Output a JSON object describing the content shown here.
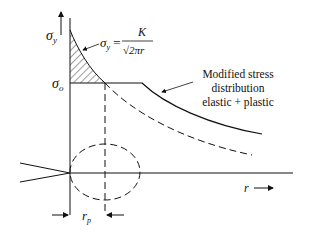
{
  "diagram": {
    "y_axis_label": "σy",
    "y_axis_sub": "y",
    "yield_label": "σo",
    "yield_sub": "o",
    "formula": {
      "lhs": "σy =",
      "numerator": "K",
      "denominator": "√2πr"
    },
    "annotation": {
      "line1": "Modified stress",
      "line2": "distribution",
      "line3": "elastic + plastic"
    },
    "x_axis_label": "r →",
    "plastic_zone_label": "rp",
    "colors": {
      "stroke": "#111111",
      "background": "#ffffff"
    }
  }
}
